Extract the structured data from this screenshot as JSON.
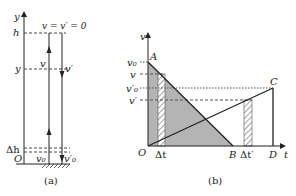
{
  "figure_a": {
    "caption": "(a)",
    "axis_label": "y",
    "top_label": "v = v′ = 0",
    "h_label": "h",
    "y_label": "y",
    "v_up_label": "v",
    "v_down_label": "v′",
    "dh_label": "Δh",
    "origin_label": "O",
    "v0_label": "v₀",
    "v0p_label": "v′₀"
  },
  "figure_b": {
    "caption": "(b)",
    "y_axis_label": "v",
    "x_axis_label": "t",
    "origin_label": "O",
    "y_ticks": [
      "v₀",
      "v",
      "v′₀",
      "v′"
    ],
    "points": {
      "A": "A",
      "B": "B",
      "C": "C",
      "D": "D"
    },
    "dt_label": "Δt",
    "dtp_label": "Δt′",
    "colors": {
      "shade": "#b4b4b4",
      "line": "#222222"
    }
  }
}
